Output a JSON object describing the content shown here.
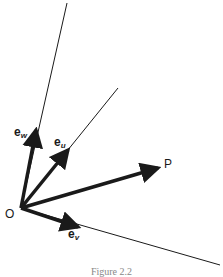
{
  "figure": {
    "caption": "Figure 2.2",
    "origin_label": "O",
    "point_label": "P",
    "vectors": [
      {
        "name": "e",
        "sub": "w"
      },
      {
        "name": "e",
        "sub": "u"
      },
      {
        "name": "e",
        "sub": "v"
      }
    ],
    "colors": {
      "ink": "#1a1a1a",
      "background": "#ffffff"
    }
  }
}
